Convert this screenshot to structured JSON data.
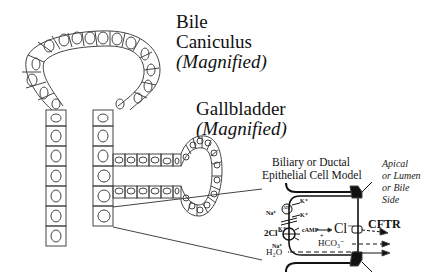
{
  "labels": {
    "bile_canaliculus": {
      "line1": "Bile",
      "line2": "Caniculus",
      "line3": "(Magnified)"
    },
    "gallbladder": {
      "line1": "Gallbladder",
      "line2": "(Magnified)"
    },
    "cell_model_title": {
      "line1": "Biliary or Ductal",
      "line2": "Epithelial Cell Model"
    },
    "side_label": {
      "line1": "Apical",
      "line2": "or Lumen",
      "line3": "or Bile",
      "line4": "Side"
    }
  },
  "transport": {
    "k_top": "K⁺",
    "atp": "ATP",
    "na_left": "Na⁺",
    "k_mid": "K⁺",
    "k_low": "K⁺",
    "two_cl": "2Cl⁻",
    "na_bottom": "Na⁺",
    "h2o": "H₂O",
    "camp": "cAMP",
    "plus": "+",
    "cl_minus": "Cl⁻",
    "cftr": "CFTR",
    "hco3": "HCO₃⁻"
  },
  "colors": {
    "line": "#333333",
    "background": "#ffffff"
  }
}
